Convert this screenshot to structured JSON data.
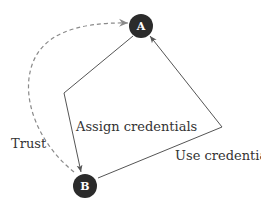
{
  "diagram": {
    "colors": {
      "node_fill": "#2b2b2b",
      "node_text": "#ffffff",
      "solid_edge": "#555555",
      "dashed_edge": "#8a8a8a",
      "label": "#333333"
    },
    "nodes": [
      {
        "id": "A",
        "label": "A"
      },
      {
        "id": "B",
        "label": "B"
      }
    ],
    "edges": [
      {
        "from": "B",
        "to": "A",
        "style": "dashed",
        "label": "Trust"
      },
      {
        "from": "A",
        "to": "B",
        "style": "solid",
        "label": "Assign credentials"
      },
      {
        "from": "B",
        "to": "A",
        "style": "solid",
        "label": "Use credentials"
      }
    ]
  }
}
